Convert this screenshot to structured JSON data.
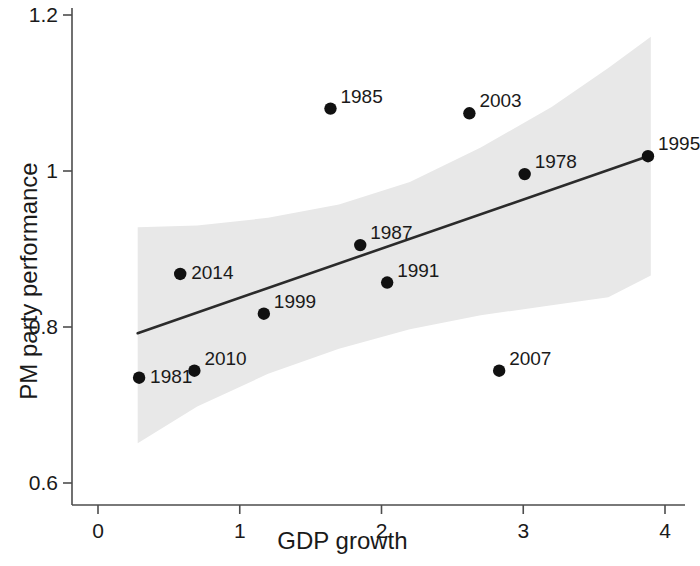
{
  "chart_data": {
    "type": "scatter",
    "title": "",
    "xlabel": "GDP growth",
    "ylabel": "PM party performance",
    "xlim": [
      -0.1,
      4.15
    ],
    "ylim": [
      0.58,
      1.225
    ],
    "xticks": [
      0,
      1,
      2,
      3,
      4
    ],
    "xtick_labels": [
      "0",
      "1",
      "2",
      "3",
      "4"
    ],
    "yticks": [
      0.6,
      0.8,
      1.0,
      1.2
    ],
    "ytick_labels": [
      "0.6",
      "0.8",
      "1",
      "1.2"
    ],
    "grid": false,
    "legend": "none",
    "point_color": "#111111",
    "line_color": "#2b2b2b",
    "band_color": "#e8e8e8",
    "axis_color": "#4d4d4d",
    "points": [
      {
        "label": "1981",
        "x": 0.29,
        "y": 0.735,
        "label_pos": "right"
      },
      {
        "label": "2014",
        "x": 0.58,
        "y": 0.868,
        "label_pos": "right"
      },
      {
        "label": "2010",
        "x": 0.68,
        "y": 0.744,
        "label_pos": "upper-right"
      },
      {
        "label": "1999",
        "x": 1.17,
        "y": 0.817,
        "label_pos": "upper-right"
      },
      {
        "label": "1985",
        "x": 1.64,
        "y": 1.08,
        "label_pos": "upper-right"
      },
      {
        "label": "1987",
        "x": 1.85,
        "y": 0.905,
        "label_pos": "upper-right"
      },
      {
        "label": "1991",
        "x": 2.04,
        "y": 0.857,
        "label_pos": "upper-right"
      },
      {
        "label": "2003",
        "x": 2.62,
        "y": 1.074,
        "label_pos": "upper-right"
      },
      {
        "label": "2007",
        "x": 2.83,
        "y": 0.744,
        "label_pos": "upper-right"
      },
      {
        "label": "1978",
        "x": 3.01,
        "y": 0.996,
        "label_pos": "upper-right"
      },
      {
        "label": "1995",
        "x": 3.88,
        "y": 1.019,
        "label_pos": "upper-right"
      }
    ],
    "fit_line": {
      "x_start": 0.28,
      "y_start": 0.792,
      "x_end": 3.88,
      "y_end": 1.019
    },
    "confidence_band": {
      "x_start": 0.28,
      "x_end": 3.9,
      "upper": [
        {
          "x": 0.28,
          "y": 0.928
        },
        {
          "x": 0.7,
          "y": 0.93
        },
        {
          "x": 1.2,
          "y": 0.94
        },
        {
          "x": 1.7,
          "y": 0.957
        },
        {
          "x": 2.2,
          "y": 0.986
        },
        {
          "x": 2.7,
          "y": 1.03
        },
        {
          "x": 3.2,
          "y": 1.082
        },
        {
          "x": 3.6,
          "y": 1.132
        },
        {
          "x": 3.9,
          "y": 1.172
        }
      ],
      "lower": [
        {
          "x": 0.28,
          "y": 0.651
        },
        {
          "x": 0.7,
          "y": 0.698
        },
        {
          "x": 1.2,
          "y": 0.74
        },
        {
          "x": 1.7,
          "y": 0.772
        },
        {
          "x": 2.2,
          "y": 0.797
        },
        {
          "x": 2.7,
          "y": 0.815
        },
        {
          "x": 3.2,
          "y": 0.828
        },
        {
          "x": 3.6,
          "y": 0.838
        },
        {
          "x": 3.9,
          "y": 0.866
        }
      ]
    }
  }
}
